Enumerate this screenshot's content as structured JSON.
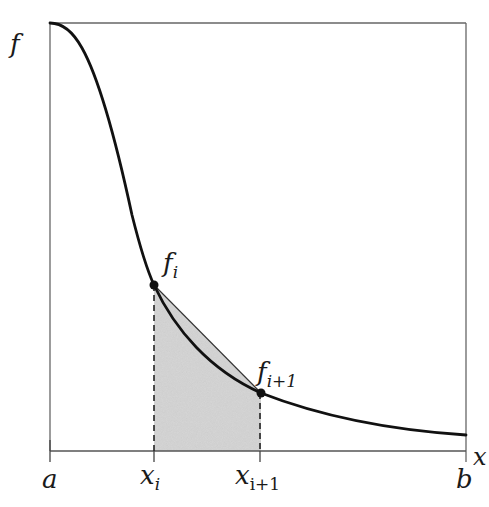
{
  "diagram": {
    "type": "trapezoidal-rule-illustration",
    "y_axis_label": "f",
    "x_axis_label": "x",
    "x_ticks": [
      {
        "label": "a",
        "sub": ""
      },
      {
        "label": "x",
        "sub": "i"
      },
      {
        "label": "x",
        "sub": "i+1"
      },
      {
        "label": "b",
        "sub": ""
      }
    ],
    "points": [
      {
        "label": "f",
        "sub": "i"
      },
      {
        "label": "f",
        "sub": "i+1"
      }
    ],
    "colors": {
      "curve": "#111111",
      "frame": "#555555",
      "shading": "#d4d4d4",
      "dashes": "#222222"
    }
  }
}
